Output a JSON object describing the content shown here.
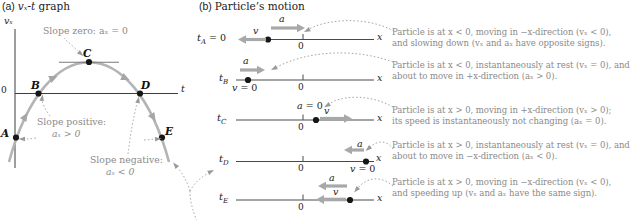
{
  "figure": {
    "panel_a": {
      "label": "(a)",
      "title_math": "vₓ-t",
      "title_rest": " graph",
      "y_axis_label": "vₓ",
      "x_axis_label": "t",
      "origin_label": "0",
      "point_labels": [
        "A",
        "B",
        "C",
        "D",
        "E"
      ],
      "annotations": {
        "slope_zero": "Slope zero: aₓ = 0",
        "slope_positive_line1": "Slope positive:",
        "slope_positive_line2": "aₓ > 0",
        "slope_negative_line1": "Slope negative:",
        "slope_negative_line2": "aₓ < 0"
      }
    },
    "panel_b": {
      "label": "(b)",
      "title": "Particle’s motion",
      "rows": [
        {
          "time_var": "t",
          "time_sub": "A",
          "time_suffix": " = 0",
          "origin": "0",
          "axis_label": "x",
          "a_label": "a",
          "v_label": "v"
        },
        {
          "time_var": "t",
          "time_sub": "B",
          "origin": "0",
          "axis_label": "x",
          "a_label": "a",
          "v_zero_var": "v",
          "v_zero_rest": " = 0"
        },
        {
          "time_var": "t",
          "time_sub": "C",
          "origin": "0",
          "axis_label": "x",
          "a_zero_var": "a",
          "a_zero_rest": " = 0",
          "v_label": "v"
        },
        {
          "time_var": "t",
          "time_sub": "D",
          "origin": "0",
          "axis_label": "x",
          "a_label": "a",
          "v_zero_var": "v",
          "v_zero_rest": " = 0"
        },
        {
          "time_var": "t",
          "time_sub": "E",
          "origin": "0",
          "axis_label": "x",
          "a_label": "a",
          "v_label": "v"
        }
      ]
    },
    "descriptions": [
      {
        "line1": "Particle is at x < 0, moving in −x-direction (vₓ < 0),",
        "line2": "and slowing down (vₓ and aₓ have opposite signs)."
      },
      {
        "line1": "Particle is at x < 0, instantaneously at rest (vₓ = 0), and",
        "line2": "about to move in +x-direction (aₓ > 0)."
      },
      {
        "line1": "Particle is at x > 0, moving in +x-direction (vₓ > 0);",
        "line2": "its speed is instantaneously not changing (aₓ = 0)."
      },
      {
        "line1": "Particle is at x > 0, instantaneously at rest (vₓ = 0), and",
        "line2": "about to move in −x-direction (aₓ < 0)."
      },
      {
        "line1": "Particle is at x > 0, moving in −x-direction (vₓ < 0),",
        "line2": "and speeding up (vₓ and aₓ have the same sign)."
      }
    ],
    "colors": {
      "curve_gray": "#b4b4b4",
      "arrow_gray": "#a8a8a8",
      "annotation_gray": "#8a8a8a",
      "ink": "#1a1a1a"
    }
  }
}
